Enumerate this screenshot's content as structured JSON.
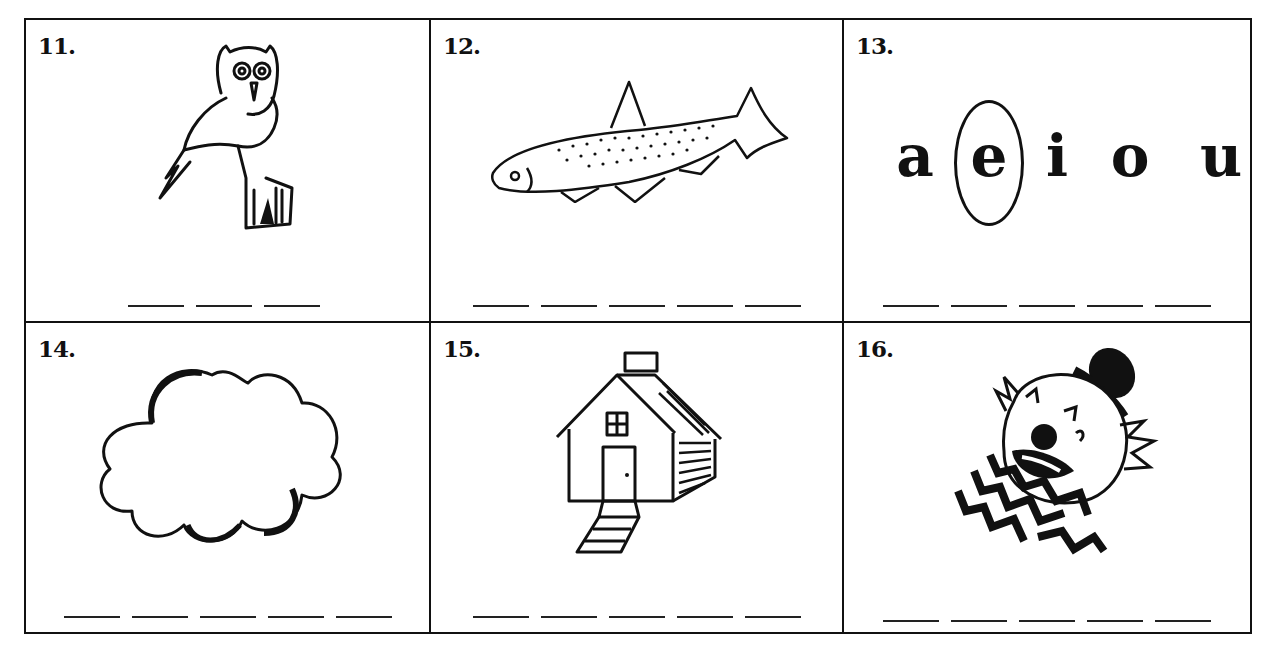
{
  "worksheet": {
    "cells": [
      {
        "number": "11.",
        "picture": "owl",
        "blanks": 3,
        "circled_vowel": null
      },
      {
        "number": "12.",
        "picture": "fish",
        "blanks": 5,
        "circled_vowel": null
      },
      {
        "number": "13.",
        "picture": "vowels",
        "blanks": 5,
        "vowels": [
          "a",
          "e",
          "i",
          "o",
          "u"
        ],
        "circled_vowel": "e"
      },
      {
        "number": "14.",
        "picture": "cloud",
        "blanks": 5,
        "circled_vowel": null
      },
      {
        "number": "15.",
        "picture": "house",
        "blanks": 5,
        "circled_vowel": null
      },
      {
        "number": "16.",
        "picture": "clown",
        "blanks": 5,
        "circled_vowel": null
      }
    ]
  }
}
